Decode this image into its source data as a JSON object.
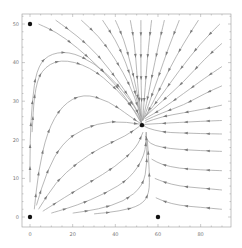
{
  "chart_data": {
    "type": "streamplot",
    "title": "",
    "xlabel": "",
    "ylabel": "",
    "xlim": [
      -4,
      94
    ],
    "ylim": [
      -2.6,
      52.6
    ],
    "x_ticks": [
      0,
      20,
      40,
      60,
      80
    ],
    "y_ticks": [
      0,
      10,
      20,
      30,
      40,
      50
    ],
    "grid": false,
    "legend": null,
    "colors": {
      "stream": "#9a9a9a",
      "arrow": "#7a7a7a",
      "point": "#111111",
      "frame": "#999999"
    },
    "equilibrium_points": [
      {
        "x": 0,
        "y": 50
      },
      {
        "x": 0,
        "y": 0
      },
      {
        "x": 60,
        "y": 0
      },
      {
        "x": 52.5,
        "y": 23.8
      }
    ],
    "streamlines": [
      [
        [
          0,
          9
        ],
        [
          0,
          20
        ],
        [
          1,
          30
        ],
        [
          3,
          38
        ],
        [
          8,
          42
        ],
        [
          18,
          43
        ],
        [
          30,
          40
        ],
        [
          42,
          34
        ],
        [
          51,
          27
        ],
        [
          52.5,
          24
        ]
      ],
      [
        [
          1,
          22
        ],
        [
          2,
          32
        ],
        [
          5,
          38
        ],
        [
          14,
          41
        ],
        [
          28,
          39
        ],
        [
          41,
          33
        ],
        [
          50,
          27
        ],
        [
          52.5,
          24
        ]
      ],
      [
        [
          2,
          2
        ],
        [
          4,
          12
        ],
        [
          8,
          22
        ],
        [
          15,
          29
        ],
        [
          25,
          32
        ],
        [
          37,
          30
        ],
        [
          47,
          26
        ],
        [
          52.5,
          24
        ]
      ],
      [
        [
          3,
          3
        ],
        [
          8,
          12
        ],
        [
          15,
          19
        ],
        [
          25,
          23
        ],
        [
          38,
          25
        ],
        [
          52.5,
          24
        ]
      ],
      [
        [
          4,
          2
        ],
        [
          12,
          9
        ],
        [
          22,
          14
        ],
        [
          33,
          18
        ],
        [
          45,
          21
        ],
        [
          52.5,
          24
        ]
      ],
      [
        [
          6,
          1.5
        ],
        [
          16,
          5
        ],
        [
          28,
          9
        ],
        [
          40,
          13
        ],
        [
          50,
          18
        ],
        [
          53,
          22
        ]
      ],
      [
        [
          10,
          1
        ],
        [
          22,
          3
        ],
        [
          35,
          6
        ],
        [
          47,
          10
        ],
        [
          54,
          16
        ],
        [
          54.5,
          22
        ]
      ],
      [
        [
          20,
          1
        ],
        [
          32,
          2
        ],
        [
          44,
          4
        ],
        [
          53,
          8
        ],
        [
          55,
          14
        ],
        [
          54.5,
          22
        ]
      ],
      [
        [
          30,
          0.8
        ],
        [
          42,
          1.5
        ],
        [
          52,
          3
        ],
        [
          56,
          6
        ],
        [
          56,
          12
        ],
        [
          55,
          20
        ]
      ],
      [
        [
          4,
          50
        ],
        [
          12,
          48
        ],
        [
          22,
          44
        ],
        [
          34,
          38
        ],
        [
          45,
          31
        ],
        [
          52.5,
          24
        ]
      ],
      [
        [
          12,
          51
        ],
        [
          22,
          47
        ],
        [
          32,
          42
        ],
        [
          43,
          34
        ],
        [
          50,
          28
        ],
        [
          52.5,
          24
        ]
      ],
      [
        [
          24,
          51
        ],
        [
          32,
          47
        ],
        [
          40,
          41
        ],
        [
          47,
          34
        ],
        [
          51,
          28
        ],
        [
          52.5,
          24
        ]
      ],
      [
        [
          34,
          51
        ],
        [
          40,
          46
        ],
        [
          45,
          40
        ],
        [
          49,
          33
        ],
        [
          52,
          26
        ]
      ],
      [
        [
          40,
          51
        ],
        [
          44,
          46
        ],
        [
          47,
          40
        ],
        [
          50,
          33
        ],
        [
          52,
          26
        ]
      ],
      [
        [
          47,
          51
        ],
        [
          49,
          45
        ],
        [
          50,
          38
        ],
        [
          51,
          31
        ],
        [
          52.5,
          25
        ]
      ],
      [
        [
          52,
          51
        ],
        [
          52,
          45
        ],
        [
          52,
          38
        ],
        [
          52.3,
          30
        ],
        [
          52.5,
          25
        ]
      ],
      [
        [
          57,
          51
        ],
        [
          55.5,
          44
        ],
        [
          54.5,
          37
        ],
        [
          53.5,
          30
        ],
        [
          52.8,
          25
        ]
      ],
      [
        [
          63,
          51
        ],
        [
          60,
          44
        ],
        [
          57,
          36
        ],
        [
          54.5,
          29
        ],
        [
          52.8,
          25
        ]
      ],
      [
        [
          70,
          51
        ],
        [
          65,
          44
        ],
        [
          60,
          36
        ],
        [
          55.5,
          29
        ],
        [
          53,
          25
        ]
      ],
      [
        [
          79,
          51
        ],
        [
          72,
          45
        ],
        [
          65,
          38
        ],
        [
          58,
          30
        ],
        [
          53.5,
          25.5
        ]
      ],
      [
        [
          89,
          50
        ],
        [
          80,
          45
        ],
        [
          70,
          38
        ],
        [
          61,
          31
        ],
        [
          54,
          26
        ]
      ],
      [
        [
          90,
          45
        ],
        [
          82,
          41
        ],
        [
          72,
          35
        ],
        [
          62,
          30
        ],
        [
          54,
          26
        ]
      ],
      [
        [
          90,
          39
        ],
        [
          82,
          36
        ],
        [
          72,
          32
        ],
        [
          62,
          28
        ],
        [
          54,
          25.5
        ]
      ],
      [
        [
          90,
          34
        ],
        [
          82,
          32
        ],
        [
          72,
          29
        ],
        [
          62,
          27
        ],
        [
          54,
          25
        ]
      ],
      [
        [
          90,
          29
        ],
        [
          82,
          28
        ],
        [
          72,
          27
        ],
        [
          62,
          26
        ],
        [
          54,
          24.5
        ]
      ],
      [
        [
          90,
          25
        ],
        [
          80,
          24.8
        ],
        [
          70,
          24.5
        ],
        [
          60,
          24.2
        ],
        [
          53.5,
          24
        ]
      ],
      [
        [
          90,
          21.5
        ],
        [
          80,
          21.6
        ],
        [
          70,
          21.8
        ],
        [
          62,
          22
        ],
        [
          55,
          23
        ],
        [
          53,
          23.8
        ]
      ],
      [
        [
          90,
          17
        ],
        [
          80,
          17.2
        ],
        [
          70,
          17.5
        ],
        [
          62,
          18
        ],
        [
          56,
          19
        ],
        [
          54,
          21
        ]
      ],
      [
        [
          90,
          12
        ],
        [
          80,
          12.2
        ],
        [
          70,
          12.6
        ],
        [
          62,
          13.5
        ],
        [
          57,
          15
        ]
      ],
      [
        [
          90,
          7
        ],
        [
          80,
          7.5
        ],
        [
          70,
          8
        ],
        [
          63,
          9
        ],
        [
          58.5,
          10
        ]
      ],
      [
        [
          90,
          2
        ],
        [
          80,
          2.5
        ],
        [
          70,
          3
        ],
        [
          63,
          4
        ],
        [
          59,
          5
        ]
      ]
    ]
  }
}
